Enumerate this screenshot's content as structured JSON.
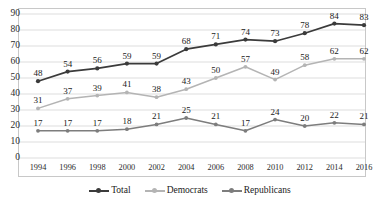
{
  "chart_data": {
    "type": "line",
    "title": "",
    "subtitle": "",
    "xlabel": "",
    "ylabel": "",
    "categories": [
      "1994",
      "1996",
      "1998",
      "2000",
      "2002",
      "2004",
      "2006",
      "2008",
      "2010",
      "2012",
      "2014",
      "2016"
    ],
    "yticks": [
      "90",
      "80",
      "70",
      "60",
      "50",
      "40",
      "30",
      "20",
      "10",
      "0"
    ],
    "ylim": [
      0,
      90
    ],
    "grid": true,
    "legend_position": "bottom",
    "data_labels": true,
    "series": [
      {
        "name": "Total",
        "color": "#3b3b3b",
        "values": [
          48,
          54,
          56,
          59,
          59,
          68,
          71,
          74,
          73,
          78,
          84,
          83
        ]
      },
      {
        "name": "Democrats",
        "color": "#b4b4b4",
        "values": [
          31,
          37,
          39,
          41,
          38,
          43,
          50,
          57,
          49,
          58,
          62,
          62
        ]
      },
      {
        "name": "Republicans",
        "color": "#7d7d7d",
        "values": [
          17,
          17,
          17,
          18,
          21,
          25,
          21,
          17,
          24,
          20,
          22,
          21
        ]
      }
    ]
  },
  "legend": {
    "items": [
      {
        "label": "Total"
      },
      {
        "label": "Democrats"
      },
      {
        "label": "Republicans"
      }
    ]
  },
  "colors": {
    "total": "#3b3b3b",
    "democrats": "#b4b4b4",
    "republicans": "#7d7d7d",
    "gridline": "#d9d9d9",
    "frame": "#c8c8c8",
    "text": "#1a1a1a",
    "background": "#ffffff"
  }
}
